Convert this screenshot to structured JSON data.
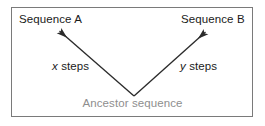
{
  "figure": {
    "background_color": "#ffffff",
    "frame_color": "#7a7a7a",
    "line_color": "#2b2b2b",
    "text_color": "#1a1a1a",
    "muted_text_color": "#8e8e8e"
  },
  "nodes": {
    "left_leaf": "Sequence A",
    "right_leaf": "Sequence B",
    "root": "Ancestor sequence"
  },
  "branches": {
    "left": {
      "variable": "x",
      "unit": "steps"
    },
    "right": {
      "variable": "y",
      "unit": "steps"
    }
  },
  "icons": {
    "left_arrow": "arrow-up-left-icon",
    "right_arrow": "arrow-up-right-icon"
  }
}
